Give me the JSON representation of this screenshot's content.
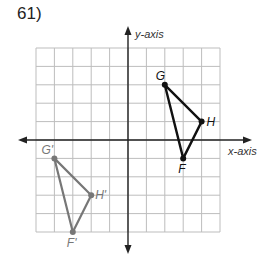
{
  "problem_number": "61)",
  "axes": {
    "x_label": "x-axis",
    "y_label": "y-axis"
  },
  "grid": {
    "x_range": [
      -5,
      5
    ],
    "y_range": [
      -5,
      5
    ],
    "unit_px": 18.4,
    "origin_px": [
      128,
      140
    ]
  },
  "original_triangle": {
    "color": "#111111",
    "points": [
      {
        "label": "G",
        "x": 2,
        "y": 3
      },
      {
        "label": "H",
        "x": 4,
        "y": 1
      },
      {
        "label": "F",
        "x": 3,
        "y": -1
      }
    ]
  },
  "image_triangle": {
    "color": "#777777",
    "points": [
      {
        "label": "G'",
        "x": -4,
        "y": -1
      },
      {
        "label": "H'",
        "x": -2,
        "y": -3
      },
      {
        "label": "F'",
        "x": -3,
        "y": -5
      }
    ]
  }
}
